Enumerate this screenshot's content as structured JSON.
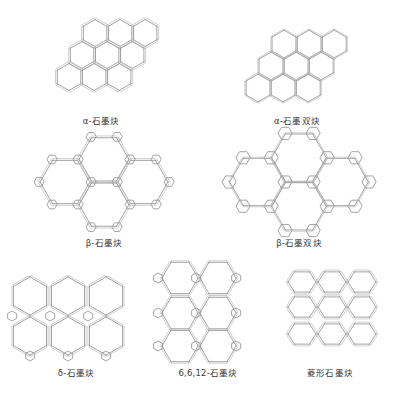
{
  "figure": {
    "title": "",
    "panels": [
      {
        "id": "alpha",
        "label": "α-石墨炔",
        "structure": "hexagonal acetylenic network (alpha-graphyne)",
        "rings_visible": 9
      },
      {
        "id": "alpha2",
        "label": "α-石墨双炔",
        "structure": "hexagonal diacetylenic network (alpha-graphdiyne)",
        "rings_visible": 9
      },
      {
        "id": "beta",
        "label": "β-石墨炔",
        "structure": "beta-graphyne network of triangles and hexagons"
      },
      {
        "id": "beta2",
        "label": "β-石墨双炔",
        "structure": "beta-graphdiyne network of triangles and hexagons"
      },
      {
        "id": "delta",
        "label": "δ-石墨炔",
        "structure": "delta-graphyne with benzene nodes"
      },
      {
        "id": "g6612",
        "label": "6,6,12-石墨炔",
        "structure": "6,6,12-graphyne rectangular lattice"
      },
      {
        "id": "rhombic",
        "label": "菱形石墨炔",
        "structure": "rhombic graphyne lattice"
      }
    ],
    "colors": {
      "bond": "#9a9a9a",
      "label": "#3a3a3a",
      "background": "#ffffff"
    }
  }
}
